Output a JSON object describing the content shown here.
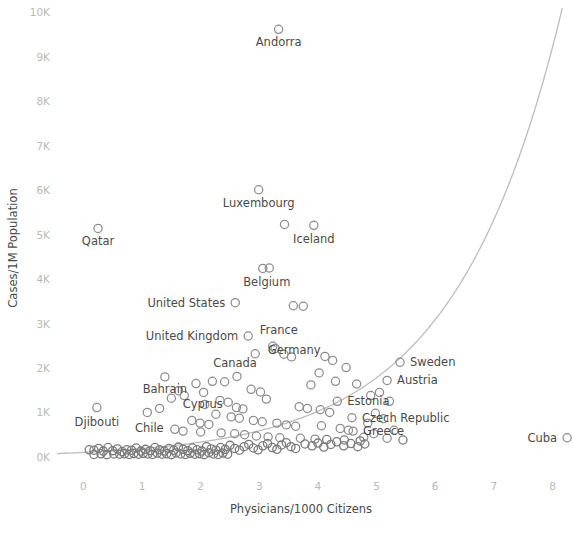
{
  "chart_data": {
    "type": "scatter",
    "title": "",
    "xlabel": "Physicians/1000 Citizens",
    "ylabel": "Cases/1M Population",
    "xlim": [
      -0.45,
      8.35
    ],
    "ylim": [
      -250,
      10100
    ],
    "xticks": [
      "0",
      "1",
      "2",
      "3",
      "4",
      "5",
      "6",
      "7",
      "8"
    ],
    "xtick_values": [
      0,
      1,
      2,
      3,
      4,
      5,
      6,
      7,
      8
    ],
    "yticks": [
      "0K",
      "1K",
      "2K",
      "3K",
      "4K",
      "5K",
      "6K",
      "7K",
      "8K",
      "9K",
      "10K"
    ],
    "ytick_values": [
      0,
      1000,
      2000,
      3000,
      4000,
      5000,
      6000,
      7000,
      8000,
      9000,
      10000
    ],
    "grid": false,
    "legend": "none",
    "marker_style": "open-circle",
    "marker_color": "#8d8d8d",
    "trend_color": "#bdbdbd",
    "trend_description": "exponential best-fit curve rising from near 0 at x=-0.4 through ~1.6K at x=4.8 and exiting top-right near x=8.0",
    "labeled_points": [
      {
        "label": "Andorra",
        "x": 3.33,
        "y": 9620,
        "label_dx": 0,
        "label_dy": 17,
        "anchor": "middle"
      },
      {
        "label": "Luxembourg",
        "x": 2.99,
        "y": 6010,
        "label_dx": 0,
        "label_dy": 17,
        "anchor": "middle"
      },
      {
        "label": "Qatar",
        "x": 0.25,
        "y": 5140,
        "label_dx": 0,
        "label_dy": 17,
        "anchor": "middle"
      },
      {
        "label": "Iceland",
        "x": 3.93,
        "y": 5210,
        "label_dx": 0,
        "label_dy": 18,
        "anchor": "middle"
      },
      {
        "label": "Belgium",
        "x": 3.06,
        "y": 4240,
        "label_dx": 4,
        "label_dy": 18,
        "anchor": "middle"
      },
      {
        "label": "United States",
        "x": 2.59,
        "y": 3470,
        "label_dx": -10,
        "label_dy": 4,
        "anchor": "end"
      },
      {
        "label": "United Kingdom",
        "x": 2.81,
        "y": 2720,
        "label_dx": -10,
        "label_dy": 4,
        "anchor": "end"
      },
      {
        "label": "France",
        "x": 3.23,
        "y": 2490,
        "label_dx": 6,
        "label_dy": -12,
        "anchor": "middle"
      },
      {
        "label": "Germany",
        "x": 4.25,
        "y": 2170,
        "label_dx": -12,
        "label_dy": -6,
        "anchor": "end"
      },
      {
        "label": "Sweden",
        "x": 5.4,
        "y": 2130,
        "label_dx": 10,
        "label_dy": 4,
        "anchor": "start"
      },
      {
        "label": "Austria",
        "x": 5.18,
        "y": 1720,
        "label_dx": 10,
        "label_dy": 4,
        "anchor": "start"
      },
      {
        "label": "Canada",
        "x": 2.62,
        "y": 1810,
        "label_dx": -2,
        "label_dy": -9,
        "anchor": "middle"
      },
      {
        "label": "Bahrain",
        "x": 1.39,
        "y": 1800,
        "label_dx": 0,
        "label_dy": 16,
        "anchor": "middle"
      },
      {
        "label": "Cyprus",
        "x": 2.07,
        "y": 1180,
        "label_dx": -2,
        "label_dy": 4,
        "anchor": "middle"
      },
      {
        "label": "Estonia",
        "x": 4.33,
        "y": 1250,
        "label_dx": 10,
        "label_dy": 4,
        "anchor": "start"
      },
      {
        "label": "Djibouti",
        "x": 0.23,
        "y": 1110,
        "label_dx": 0,
        "label_dy": 18,
        "anchor": "middle"
      },
      {
        "label": "Chile",
        "x": 1.09,
        "y": 1000,
        "label_dx": 2,
        "label_dy": 20,
        "anchor": "middle"
      },
      {
        "label": "Czech Republic",
        "x": 4.58,
        "y": 880,
        "label_dx": 10,
        "label_dy": 4,
        "anchor": "start"
      },
      {
        "label": "Greece",
        "x": 4.6,
        "y": 580,
        "label_dx": 10,
        "label_dy": 4,
        "anchor": "start"
      },
      {
        "label": "Cuba",
        "x": 8.25,
        "y": 430,
        "label_dx": -10,
        "label_dy": 4,
        "anchor": "end"
      }
    ],
    "unlabeled_points": [
      {
        "x": 3.43,
        "y": 5230
      },
      {
        "x": 3.17,
        "y": 4250
      },
      {
        "x": 3.58,
        "y": 3400
      },
      {
        "x": 3.75,
        "y": 3390
      },
      {
        "x": 3.27,
        "y": 2440
      },
      {
        "x": 3.42,
        "y": 2310
      },
      {
        "x": 3.55,
        "y": 2250
      },
      {
        "x": 2.93,
        "y": 2320
      },
      {
        "x": 4.12,
        "y": 2260
      },
      {
        "x": 4.48,
        "y": 2010
      },
      {
        "x": 4.02,
        "y": 1890
      },
      {
        "x": 3.88,
        "y": 1620
      },
      {
        "x": 4.3,
        "y": 1700
      },
      {
        "x": 4.66,
        "y": 1640
      },
      {
        "x": 1.92,
        "y": 1650
      },
      {
        "x": 2.2,
        "y": 1700
      },
      {
        "x": 2.41,
        "y": 1690
      },
      {
        "x": 1.62,
        "y": 1490
      },
      {
        "x": 1.72,
        "y": 1380
      },
      {
        "x": 2.05,
        "y": 1450
      },
      {
        "x": 2.86,
        "y": 1520
      },
      {
        "x": 3.02,
        "y": 1460
      },
      {
        "x": 3.12,
        "y": 1300
      },
      {
        "x": 1.5,
        "y": 1320
      },
      {
        "x": 2.33,
        "y": 1270
      },
      {
        "x": 2.47,
        "y": 1230
      },
      {
        "x": 1.3,
        "y": 1090
      },
      {
        "x": 2.61,
        "y": 1110
      },
      {
        "x": 2.72,
        "y": 1080
      },
      {
        "x": 3.68,
        "y": 1130
      },
      {
        "x": 3.82,
        "y": 1090
      },
      {
        "x": 4.04,
        "y": 1060
      },
      {
        "x": 4.2,
        "y": 1000
      },
      {
        "x": 2.26,
        "y": 960
      },
      {
        "x": 2.52,
        "y": 900
      },
      {
        "x": 2.66,
        "y": 870
      },
      {
        "x": 2.9,
        "y": 820
      },
      {
        "x": 3.05,
        "y": 790
      },
      {
        "x": 1.85,
        "y": 820
      },
      {
        "x": 1.99,
        "y": 760
      },
      {
        "x": 2.14,
        "y": 730
      },
      {
        "x": 3.3,
        "y": 760
      },
      {
        "x": 3.46,
        "y": 720
      },
      {
        "x": 3.62,
        "y": 690
      },
      {
        "x": 4.06,
        "y": 700
      },
      {
        "x": 4.38,
        "y": 640
      },
      {
        "x": 4.52,
        "y": 600
      },
      {
        "x": 1.56,
        "y": 620
      },
      {
        "x": 1.7,
        "y": 580
      },
      {
        "x": 2.0,
        "y": 560
      },
      {
        "x": 2.35,
        "y": 540
      },
      {
        "x": 2.58,
        "y": 520
      },
      {
        "x": 2.75,
        "y": 500
      },
      {
        "x": 2.95,
        "y": 470
      },
      {
        "x": 3.15,
        "y": 450
      },
      {
        "x": 3.35,
        "y": 430
      },
      {
        "x": 3.7,
        "y": 420
      },
      {
        "x": 3.95,
        "y": 400
      },
      {
        "x": 4.15,
        "y": 390
      },
      {
        "x": 4.45,
        "y": 380
      },
      {
        "x": 4.72,
        "y": 360
      },
      {
        "x": 0.1,
        "y": 160
      },
      {
        "x": 0.18,
        "y": 150
      },
      {
        "x": 0.26,
        "y": 190
      },
      {
        "x": 0.34,
        "y": 130
      },
      {
        "x": 0.42,
        "y": 210
      },
      {
        "x": 0.5,
        "y": 140
      },
      {
        "x": 0.58,
        "y": 180
      },
      {
        "x": 0.66,
        "y": 120
      },
      {
        "x": 0.74,
        "y": 160
      },
      {
        "x": 0.82,
        "y": 150
      },
      {
        "x": 0.9,
        "y": 200
      },
      {
        "x": 0.98,
        "y": 130
      },
      {
        "x": 1.06,
        "y": 170
      },
      {
        "x": 1.14,
        "y": 140
      },
      {
        "x": 1.22,
        "y": 210
      },
      {
        "x": 1.3,
        "y": 160
      },
      {
        "x": 1.38,
        "y": 130
      },
      {
        "x": 1.46,
        "y": 190
      },
      {
        "x": 1.54,
        "y": 150
      },
      {
        "x": 1.62,
        "y": 220
      },
      {
        "x": 1.7,
        "y": 170
      },
      {
        "x": 1.78,
        "y": 140
      },
      {
        "x": 1.86,
        "y": 200
      },
      {
        "x": 1.94,
        "y": 160
      },
      {
        "x": 2.02,
        "y": 130
      },
      {
        "x": 2.1,
        "y": 230
      },
      {
        "x": 2.18,
        "y": 180
      },
      {
        "x": 2.26,
        "y": 150
      },
      {
        "x": 2.34,
        "y": 210
      },
      {
        "x": 2.42,
        "y": 170
      },
      {
        "x": 2.5,
        "y": 260
      },
      {
        "x": 2.58,
        "y": 190
      },
      {
        "x": 2.66,
        "y": 150
      },
      {
        "x": 2.74,
        "y": 230
      },
      {
        "x": 2.82,
        "y": 280
      },
      {
        "x": 2.9,
        "y": 200
      },
      {
        "x": 2.98,
        "y": 160
      },
      {
        "x": 3.06,
        "y": 250
      },
      {
        "x": 3.14,
        "y": 300
      },
      {
        "x": 3.22,
        "y": 210
      },
      {
        "x": 3.3,
        "y": 170
      },
      {
        "x": 3.38,
        "y": 270
      },
      {
        "x": 3.46,
        "y": 320
      },
      {
        "x": 3.54,
        "y": 230
      },
      {
        "x": 3.62,
        "y": 190
      },
      {
        "x": 3.78,
        "y": 290
      },
      {
        "x": 3.9,
        "y": 250
      },
      {
        "x": 4.0,
        "y": 310
      },
      {
        "x": 4.1,
        "y": 220
      },
      {
        "x": 4.22,
        "y": 280
      },
      {
        "x": 4.32,
        "y": 340
      },
      {
        "x": 4.44,
        "y": 250
      },
      {
        "x": 4.56,
        "y": 300
      },
      {
        "x": 4.68,
        "y": 230
      },
      {
        "x": 4.8,
        "y": 290
      },
      {
        "x": 0.62,
        "y": 60
      },
      {
        "x": 0.7,
        "y": 70
      },
      {
        "x": 0.78,
        "y": 55
      },
      {
        "x": 0.86,
        "y": 75
      },
      {
        "x": 0.94,
        "y": 60
      },
      {
        "x": 1.02,
        "y": 80
      },
      {
        "x": 1.1,
        "y": 65
      },
      {
        "x": 1.18,
        "y": 55
      },
      {
        "x": 1.26,
        "y": 85
      },
      {
        "x": 1.34,
        "y": 60
      },
      {
        "x": 1.42,
        "y": 70
      },
      {
        "x": 1.5,
        "y": 50
      },
      {
        "x": 1.58,
        "y": 90
      },
      {
        "x": 1.66,
        "y": 65
      },
      {
        "x": 1.74,
        "y": 55
      },
      {
        "x": 1.82,
        "y": 80
      },
      {
        "x": 1.9,
        "y": 60
      },
      {
        "x": 1.98,
        "y": 70
      },
      {
        "x": 2.06,
        "y": 50
      },
      {
        "x": 2.14,
        "y": 95
      },
      {
        "x": 2.22,
        "y": 65
      },
      {
        "x": 2.3,
        "y": 55
      },
      {
        "x": 2.38,
        "y": 85
      },
      {
        "x": 2.46,
        "y": 60
      },
      {
        "x": 0.18,
        "y": 55
      },
      {
        "x": 0.3,
        "y": 70
      },
      {
        "x": 0.4,
        "y": 50
      },
      {
        "x": 0.52,
        "y": 65
      },
      {
        "x": 5.05,
        "y": 1450
      },
      {
        "x": 5.22,
        "y": 1250
      },
      {
        "x": 4.9,
        "y": 1380
      },
      {
        "x": 4.98,
        "y": 980
      },
      {
        "x": 5.12,
        "y": 860
      },
      {
        "x": 4.85,
        "y": 760
      },
      {
        "x": 4.95,
        "y": 520
      },
      {
        "x": 5.3,
        "y": 600
      },
      {
        "x": 5.18,
        "y": 420
      },
      {
        "x": 4.78,
        "y": 440
      },
      {
        "x": 5.45,
        "y": 380
      }
    ]
  }
}
